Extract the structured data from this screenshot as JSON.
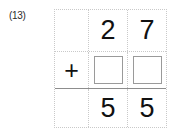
{
  "problem": {
    "label": "(13)",
    "operator": "+",
    "type": "vertical-addition"
  },
  "grid": {
    "columns": [
      "operator",
      "tens",
      "ones"
    ],
    "rows": [
      {
        "name": "addend",
        "cells": [
          {
            "kind": "empty",
            "value": ""
          },
          {
            "kind": "digit",
            "value": "2"
          },
          {
            "kind": "digit",
            "value": "7"
          }
        ]
      },
      {
        "name": "operator",
        "cells": [
          {
            "kind": "operator",
            "value": "+"
          },
          {
            "kind": "answer-box",
            "value": ""
          },
          {
            "kind": "answer-box",
            "value": ""
          }
        ]
      },
      {
        "name": "sum",
        "cells": [
          {
            "kind": "empty",
            "value": ""
          },
          {
            "kind": "digit",
            "value": "5"
          },
          {
            "kind": "digit",
            "value": "5"
          }
        ]
      }
    ]
  },
  "colors": {
    "grid_line": "#c9c9c9",
    "sum_line": "#8d8d8d",
    "answer_box_border": "#9a9a9a",
    "digit": "#111111",
    "label": "#2b2b2b",
    "background": "#ffffff"
  }
}
